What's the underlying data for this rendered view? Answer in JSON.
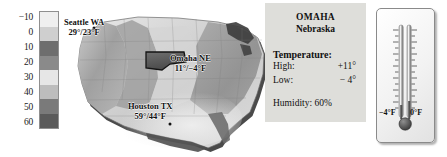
{
  "legend": {
    "name": "temperature-color-scale",
    "unit": "°F",
    "labels": [
      "−10",
      "0",
      "10",
      "20",
      "30",
      "40",
      "50",
      "60"
    ],
    "colors": [
      "#efefef",
      "#cfcfcf",
      "#6e6e6e",
      "#8a8a8a",
      "#e6e6e6",
      "#bdbdbd",
      "#7a7a7a",
      "#5a5a5a"
    ]
  },
  "map": {
    "name": "us-temperature-map",
    "highlight_state": "Nebraska",
    "cities": [
      {
        "name": "Seattle WA",
        "temps": "29°/23°F",
        "high": 29,
        "low": 23
      },
      {
        "name": "Omaha NE",
        "temps": "11°/−4°F",
        "high": 11,
        "low": -4
      },
      {
        "name": "Houston TX",
        "temps": "59°/44°F",
        "high": 59,
        "low": 44
      }
    ]
  },
  "info": {
    "city": "OMAHA",
    "state": "Nebraska",
    "temperature_heading": "Temperature:",
    "high_label": "High:",
    "high_value": "+11°",
    "low_label": "Low:",
    "low_value": "− 4°",
    "humidity": "Humidity: 60%"
  },
  "thermometer": {
    "name": "dual-thermometer",
    "left_label": "−4°F",
    "right_label": "0°F",
    "left_value": -4,
    "right_value": 0
  },
  "colors": {
    "panel_bg": "#dededa",
    "text": "#111111",
    "mercury": "#6b6b6b"
  }
}
